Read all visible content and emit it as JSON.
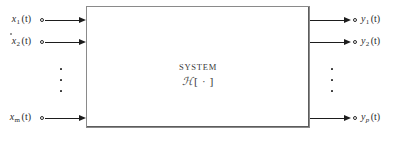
{
  "figure": {
    "type": "block-diagram",
    "name": "multiple-input-multiple-output-system",
    "block": {
      "title": "SYSTEM",
      "operator_symbol": "ℋ",
      "operator_brackets": "[ · ]",
      "operator_label": "ℋ [ · ]"
    },
    "inputs": [
      {
        "base": "x",
        "subscript": "1",
        "arg": "(t)",
        "label": "x₁(t)"
      },
      {
        "base": "x",
        "subscript": "2",
        "arg": "(t)",
        "label": "x₂(t)"
      },
      {
        "base": "x",
        "subscript": "m",
        "arg": "(t)",
        "label": "xₘ(t)"
      }
    ],
    "outputs": [
      {
        "base": "y",
        "subscript": "1",
        "arg": "(t)",
        "label": "y₁(t)"
      },
      {
        "base": "y",
        "subscript": "2",
        "arg": "(t)",
        "label": "y₂(t)"
      },
      {
        "base": "y",
        "subscript": "p",
        "arg": "(t)",
        "label": "yₚ(t)"
      }
    ],
    "ellipsis": {
      "glyph": "⋮",
      "dot_count": 3
    },
    "colors": {
      "background": "#ffffff",
      "line": "#1d1d1d",
      "box_border": "#8a8a8a",
      "text": "#2b2b2b",
      "block_text": "#3a3a3a"
    }
  }
}
